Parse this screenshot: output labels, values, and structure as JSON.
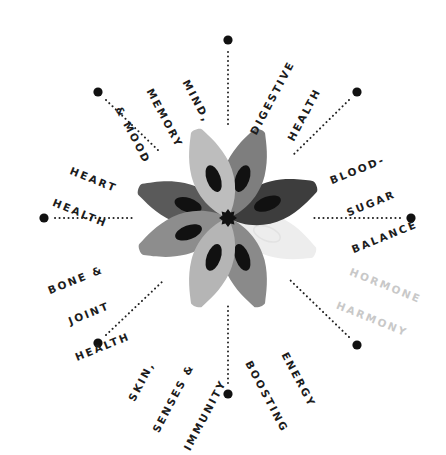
{
  "diagram": {
    "type": "radial-flower",
    "center": {
      "x": 228,
      "y": 218
    },
    "colors": {
      "dark": "#3a3a3a",
      "mid_dark": "#5e5e5e",
      "mid": "#8a8a8a",
      "light": "#b2b2b2",
      "faded": "#ececec",
      "seed": "#111111",
      "text": "#1c1c1c",
      "text_faded": "#c8c8c8",
      "dot": "#111111"
    },
    "categories": [
      {
        "id": "mind",
        "lines": [
          "MIND,",
          "MEMORY",
          "& MOOD"
        ],
        "faded": false
      },
      {
        "id": "digestive",
        "lines": [
          "DIGESTIVE",
          "HEALTH"
        ],
        "faded": false
      },
      {
        "id": "blood-sugar",
        "lines": [
          "BLOOD-",
          "SUGAR",
          "BALANCE"
        ],
        "faded": false
      },
      {
        "id": "hormone",
        "lines": [
          "HORMONE",
          "HARMONY"
        ],
        "faded": true
      },
      {
        "id": "energy",
        "lines": [
          "ENERGY",
          "BOOSTING"
        ],
        "faded": false
      },
      {
        "id": "skin",
        "lines": [
          "SKIN,",
          "SENSES &",
          "IMMUNITY"
        ],
        "faded": false
      },
      {
        "id": "bone",
        "lines": [
          "BONE &",
          "JOINT",
          "HEALTH"
        ],
        "faded": false
      },
      {
        "id": "heart",
        "lines": [
          "HEART",
          "HEALTH"
        ],
        "faded": false
      }
    ]
  }
}
